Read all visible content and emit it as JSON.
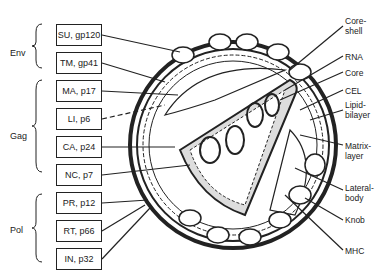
{
  "groups": [
    {
      "label": "Env",
      "top": 48,
      "brace_top": 24,
      "brace_bottom": 68
    },
    {
      "label": "Gag",
      "top": 131,
      "brace_top": 80,
      "brace_bottom": 172
    },
    {
      "label": "Pol",
      "top": 225,
      "brace_top": 194,
      "brace_bottom": 262
    }
  ],
  "boxes": [
    {
      "label": "SU, gp120",
      "top": 24
    },
    {
      "label": "TM, gp41",
      "top": 52
    },
    {
      "label": "MA, p17",
      "top": 80
    },
    {
      "label": "LI, p6",
      "top": 108
    },
    {
      "label": "CA, p24",
      "top": 136
    },
    {
      "label": "NC, p7",
      "top": 164
    },
    {
      "label": "PR, p12",
      "top": 192
    },
    {
      "label": "RT, p66",
      "top": 220
    },
    {
      "label": "IN, p32",
      "top": 248
    }
  ],
  "right_labels": [
    {
      "label": "Core-\nshell",
      "top": 16
    },
    {
      "label": "RNA",
      "top": 52
    },
    {
      "label": "Core",
      "top": 68
    },
    {
      "label": "CEL",
      "top": 86
    },
    {
      "label": "Lipid-\nbilayer",
      "top": 100
    },
    {
      "label": "Matrix-\nlayer",
      "top": 141
    },
    {
      "label": "Lateral-\nbody",
      "top": 183
    },
    {
      "label": "Knob",
      "top": 215
    },
    {
      "label": "MHC",
      "top": 246
    }
  ],
  "colors": {
    "ink": "#222222",
    "background": "#ffffff"
  }
}
